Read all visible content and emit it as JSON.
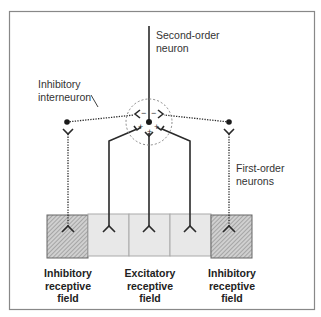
{
  "diagram": {
    "labels": {
      "second_order_line1": "Second-order",
      "second_order_line2": "neuron",
      "interneuron_line1": "Inhibitory",
      "interneuron_line2": "interneuron",
      "first_order_line1": "First-order",
      "first_order_line2": "neurons"
    },
    "synapse_signs": {
      "upper_left": "−",
      "upper_right": "−",
      "lower_left": "+",
      "lower_center": "+",
      "lower_right": "+"
    },
    "fields": [
      {
        "line1": "Inhibitory",
        "line2": "receptive",
        "line3": "field"
      },
      {
        "line1": "Excitatory",
        "line2": "receptive",
        "line3": "field"
      },
      {
        "line1": "Inhibitory",
        "line2": "receptive",
        "line3": "field"
      }
    ],
    "colors": {
      "line": "#2a2a2a",
      "hatch_bg": "#c8c8c8",
      "excitatory_bg": "#e6e6e6",
      "frame": "#888888"
    }
  }
}
